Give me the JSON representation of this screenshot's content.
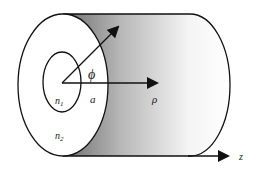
{
  "figure": {
    "labels": {
      "phi": "ϕ",
      "core_radius": "a",
      "rho": "ρ",
      "core_index": "n",
      "core_index_sub": "1",
      "cladding_index": "n",
      "cladding_index_sub": "2",
      "axis_z": "z"
    },
    "colors": {
      "stroke": "#111111",
      "shade_dark": "#7a7a7a",
      "shade_light": "#ffffff",
      "background": "#ffffff"
    }
  }
}
